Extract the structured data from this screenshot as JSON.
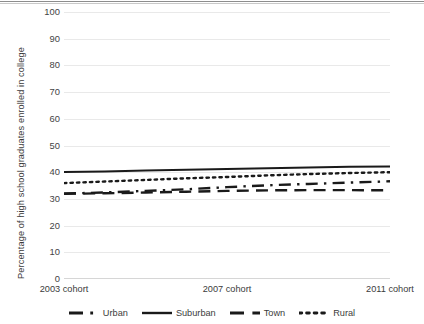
{
  "chart_data": {
    "type": "line",
    "title": "",
    "xlabel": "",
    "ylabel": "Percentage of high school graduates enrolled in college",
    "ylim": [
      0,
      100
    ],
    "ytick_step": 10,
    "yticks": [
      "100",
      "90",
      "80",
      "70",
      "60",
      "50",
      "40",
      "30",
      "20",
      "10",
      "0"
    ],
    "grid": true,
    "legend_position": "bottom",
    "categories": [
      "2003 cohort",
      "2004 cohort",
      "2005 cohort",
      "2006 cohort",
      "2007 cohort",
      "2008 cohort",
      "2009 cohort",
      "2010 cohort",
      "2011 cohort"
    ],
    "xtick_labels": [
      "2003 cohort",
      "2007 cohort",
      "2011 cohort"
    ],
    "series": [
      {
        "name": "Urban",
        "style": "dash-dot",
        "color": "#1a1a1a",
        "values": [
          32.0,
          32.4,
          33.0,
          33.6,
          34.4,
          35.1,
          35.6,
          36.1,
          36.6
        ]
      },
      {
        "name": "Suburban",
        "style": "solid",
        "color": "#1a1a1a",
        "values": [
          40.1,
          40.3,
          40.6,
          40.9,
          41.2,
          41.5,
          41.8,
          42.0,
          42.1
        ]
      },
      {
        "name": "Town",
        "style": "dashed",
        "color": "#1a1a1a",
        "values": [
          31.9,
          32.1,
          32.4,
          32.7,
          33.0,
          33.2,
          33.3,
          33.3,
          33.2
        ]
      },
      {
        "name": "Rural",
        "style": "dotted",
        "color": "#1a1a1a",
        "values": [
          35.9,
          36.5,
          37.1,
          37.7,
          38.2,
          38.8,
          39.3,
          39.7,
          40.0
        ]
      }
    ]
  },
  "legend": {
    "items": [
      {
        "label": "Urban",
        "icon": "dash-dot-line-icon"
      },
      {
        "label": "Suburban",
        "icon": "solid-line-icon"
      },
      {
        "label": "Town",
        "icon": "dashed-line-icon"
      },
      {
        "label": "Rural",
        "icon": "dotted-line-icon"
      }
    ]
  }
}
